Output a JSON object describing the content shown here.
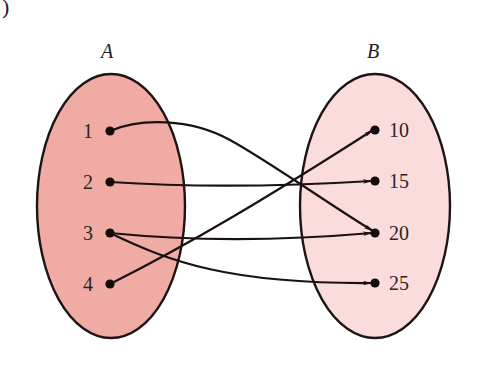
{
  "figure": {
    "corner_glyph": ")",
    "colors": {
      "set_a_fill": "#f0aca4",
      "set_b_fill": "#fadcdc",
      "stroke": "#1e1414"
    }
  },
  "set_a": {
    "label": "A",
    "elements": [
      {
        "id": "a1",
        "label": "1"
      },
      {
        "id": "a2",
        "label": "2"
      },
      {
        "id": "a3",
        "label": "3"
      },
      {
        "id": "a4",
        "label": "4"
      }
    ]
  },
  "set_b": {
    "label": "B",
    "elements": [
      {
        "id": "b10",
        "label": "10"
      },
      {
        "id": "b15",
        "label": "15"
      },
      {
        "id": "b20",
        "label": "20"
      },
      {
        "id": "b25",
        "label": "25"
      }
    ]
  },
  "mappings": [
    {
      "from": "1",
      "to": "20"
    },
    {
      "from": "2",
      "to": "15"
    },
    {
      "from": "3",
      "to": "20"
    },
    {
      "from": "3",
      "to": "25"
    },
    {
      "from": "4",
      "to": "10"
    }
  ]
}
